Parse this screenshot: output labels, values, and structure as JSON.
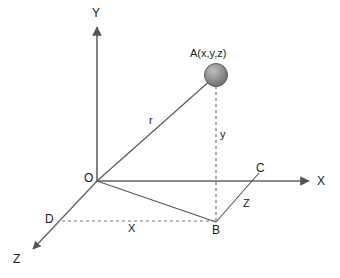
{
  "figure": {
    "background_color": "#ffffff",
    "line_color": "#555555",
    "label_color": "#1a1a1a",
    "sphere_color_light": "#b0b0b0",
    "sphere_color_dark": "#6e6e6e"
  },
  "axes": [
    {
      "name": "y-axis",
      "label": "Y",
      "label_x": 92,
      "label_y": 17,
      "style": "solid-arrow"
    },
    {
      "name": "x-axis",
      "label": "X",
      "label_x": 317,
      "label_y": 185,
      "style": "solid-arrow"
    },
    {
      "name": "z-axis",
      "label": "Z",
      "label_x": 13,
      "label_y": 263,
      "style": "solid-arrow"
    }
  ],
  "points": [
    {
      "name": "origin",
      "label": "O",
      "x": 97,
      "y": 181,
      "label_x": 84,
      "label_y": 182
    },
    {
      "name": "point-a",
      "label": "A(x,y,z)",
      "x": 216,
      "y": 75,
      "label_x": 190,
      "label_y": 57
    },
    {
      "name": "point-b",
      "label": "B",
      "x": 216,
      "y": 222,
      "label_x": 212,
      "label_y": 234
    },
    {
      "name": "point-c",
      "label": "C",
      "x": 258,
      "y": 174,
      "label_x": 256,
      "label_y": 172
    },
    {
      "name": "point-d",
      "label": "D",
      "x": 62,
      "y": 220,
      "label_x": 45,
      "label_y": 223
    }
  ],
  "segments": [
    {
      "name": "radius-oa",
      "label": "r",
      "label_x": 149,
      "label_y": 124,
      "style": "solid"
    },
    {
      "name": "height-ab",
      "label": "y",
      "label_x": 220,
      "label_y": 138,
      "style": "dashed"
    },
    {
      "name": "depth-bc",
      "label": "Z",
      "label_x": 243,
      "label_y": 207,
      "style": "solid"
    },
    {
      "name": "width-db",
      "label": "X",
      "label_x": 128,
      "label_y": 232,
      "style": "dashed"
    },
    {
      "name": "projection-ob",
      "label": "",
      "label_x": 0,
      "label_y": 0,
      "style": "solid"
    }
  ]
}
